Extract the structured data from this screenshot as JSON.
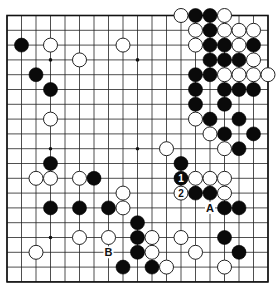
{
  "board": {
    "size": 19,
    "origin_x": 7,
    "origin_y": 15.5,
    "step_x": 14.5,
    "step_y": 14.8,
    "stone_radius": 7,
    "star_points": [
      [
        3,
        3
      ],
      [
        9,
        3
      ],
      [
        15,
        3
      ],
      [
        3,
        9
      ],
      [
        9,
        9
      ],
      [
        15,
        9
      ],
      [
        3,
        15
      ],
      [
        9,
        15
      ],
      [
        15,
        15
      ]
    ],
    "colors": {
      "black": "#0a0a0a",
      "white": "#ffffff",
      "line": "#222222",
      "background": "#ffffff"
    }
  },
  "stones": {
    "black": [
      [
        1,
        2
      ],
      [
        2,
        4
      ],
      [
        3,
        5
      ],
      [
        13,
        0
      ],
      [
        14,
        0
      ],
      [
        14,
        1
      ],
      [
        14,
        2
      ],
      [
        15,
        2
      ],
      [
        17,
        2
      ],
      [
        14,
        3
      ],
      [
        15,
        3
      ],
      [
        16,
        3
      ],
      [
        13,
        4
      ],
      [
        14,
        4
      ],
      [
        13,
        5
      ],
      [
        15,
        5
      ],
      [
        16,
        5
      ],
      [
        17,
        5
      ],
      [
        13,
        6
      ],
      [
        15,
        6
      ],
      [
        14,
        7
      ],
      [
        16,
        7
      ],
      [
        15,
        8
      ],
      [
        17,
        8
      ],
      [
        16,
        9
      ],
      [
        12,
        10
      ],
      [
        3,
        10
      ],
      [
        6,
        11
      ],
      [
        13,
        12
      ],
      [
        14,
        12
      ],
      [
        3,
        13
      ],
      [
        5,
        13
      ],
      [
        7,
        13
      ],
      [
        15,
        13
      ],
      [
        16,
        13
      ],
      [
        9,
        14
      ],
      [
        9,
        15
      ],
      [
        15,
        15
      ],
      [
        9,
        16
      ],
      [
        16,
        16
      ],
      [
        8,
        17
      ],
      [
        10,
        17
      ]
    ],
    "white": [
      [
        12,
        0
      ],
      [
        15,
        0
      ],
      [
        13,
        1
      ],
      [
        15,
        1
      ],
      [
        16,
        1
      ],
      [
        17,
        1
      ],
      [
        13,
        2
      ],
      [
        16,
        2
      ],
      [
        17,
        3
      ],
      [
        15,
        4
      ],
      [
        16,
        4
      ],
      [
        17,
        4
      ],
      [
        18,
        4
      ],
      [
        13,
        7
      ],
      [
        14,
        8
      ],
      [
        15,
        9
      ],
      [
        11,
        9
      ],
      [
        3,
        2
      ],
      [
        8,
        2
      ],
      [
        5,
        3
      ],
      [
        3,
        7
      ],
      [
        2,
        11
      ],
      [
        3,
        11
      ],
      [
        5,
        11
      ],
      [
        13,
        11
      ],
      [
        14,
        11
      ],
      [
        15,
        11
      ],
      [
        15,
        12
      ],
      [
        8,
        12
      ],
      [
        8,
        13
      ],
      [
        5,
        15
      ],
      [
        7,
        15
      ],
      [
        10,
        15
      ],
      [
        12,
        15
      ],
      [
        2,
        16
      ],
      [
        10,
        16
      ],
      [
        13,
        16
      ],
      [
        11,
        17
      ],
      [
        15,
        17
      ]
    ]
  },
  "numbered_moves": [
    {
      "number": "1",
      "color": "black",
      "col": 12,
      "row": 11
    },
    {
      "number": "2",
      "color": "white",
      "col": 12,
      "row": 12
    }
  ],
  "letter_labels": [
    {
      "text": "A",
      "col": 14,
      "row": 13
    },
    {
      "text": "B",
      "col": 7,
      "row": 16
    }
  ]
}
